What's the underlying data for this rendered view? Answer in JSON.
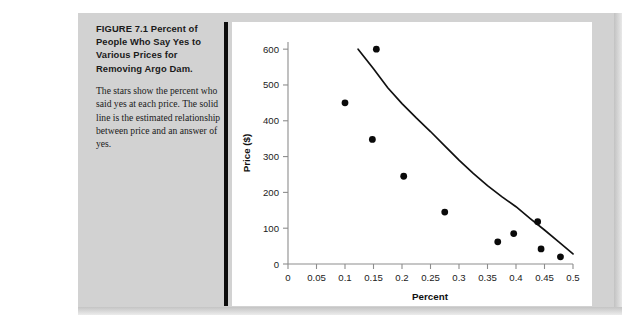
{
  "figure": {
    "label": "FIGURE 7.1",
    "title": "Percent of People Who Say Yes to Various Prices for Removing Argo Dam.",
    "title_line1": "FIGURE 7.1  Percent of People",
    "title_line2": "Who Say Yes to Various Prices",
    "title_line3": "for Removing Argo Dam.",
    "body": "The stars show the percent who said yes at each price. The solid line is the estimated relationship between price and an answer of yes."
  },
  "colors": {
    "page_band": "#d2d2d2",
    "divider": "#0d0d0d",
    "plot_background": "#ffffff",
    "axis": "#8d8d8d",
    "point": "#0a0a0a",
    "curve": "#111111"
  },
  "chart_data": {
    "type": "scatter",
    "title": "",
    "xlabel": "Percent",
    "ylabel": "Price ($)",
    "xlim": [
      0,
      0.5
    ],
    "ylim": [
      0,
      620
    ],
    "grid": false,
    "legend": "none",
    "xticks": [
      0,
      0.05,
      0.1,
      0.15,
      0.2,
      0.25,
      0.3,
      0.35,
      0.4,
      0.45,
      0.5
    ],
    "xticklabels": [
      "0",
      "0.05",
      "0.1",
      "0.15",
      "0.2",
      "0.25",
      "0.3",
      "0.35",
      "0.4",
      "0.45",
      "0.5"
    ],
    "yticks": [
      0,
      100,
      200,
      300,
      400,
      500,
      600
    ],
    "yticklabels": [
      "0",
      "100",
      "200",
      "300",
      "400",
      "500",
      "600"
    ],
    "series": [
      {
        "name": "Percent saying yes at each price",
        "type": "scatter",
        "marker": "circle",
        "points": [
          {
            "x": 0.1,
            "y": 450
          },
          {
            "x": 0.148,
            "y": 348
          },
          {
            "x": 0.155,
            "y": 600
          },
          {
            "x": 0.203,
            "y": 245
          },
          {
            "x": 0.275,
            "y": 145
          },
          {
            "x": 0.368,
            "y": 62
          },
          {
            "x": 0.396,
            "y": 85
          },
          {
            "x": 0.438,
            "y": 118
          },
          {
            "x": 0.444,
            "y": 42
          },
          {
            "x": 0.478,
            "y": 20
          }
        ]
      },
      {
        "name": "Estimated relationship between price and an answer of yes",
        "type": "line",
        "points": [
          {
            "x": 0.123,
            "y": 600
          },
          {
            "x": 0.15,
            "y": 545
          },
          {
            "x": 0.175,
            "y": 492
          },
          {
            "x": 0.2,
            "y": 448
          },
          {
            "x": 0.225,
            "y": 408
          },
          {
            "x": 0.25,
            "y": 370
          },
          {
            "x": 0.275,
            "y": 330
          },
          {
            "x": 0.3,
            "y": 290
          },
          {
            "x": 0.325,
            "y": 253
          },
          {
            "x": 0.35,
            "y": 219
          },
          {
            "x": 0.375,
            "y": 188
          },
          {
            "x": 0.4,
            "y": 160
          },
          {
            "x": 0.425,
            "y": 127
          },
          {
            "x": 0.45,
            "y": 95
          },
          {
            "x": 0.475,
            "y": 62
          },
          {
            "x": 0.5,
            "y": 28
          }
        ]
      }
    ]
  }
}
